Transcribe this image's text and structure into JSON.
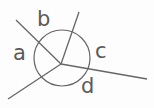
{
  "diagram": {
    "type": "angles-around-point",
    "center": {
      "x": 61,
      "y": 64
    },
    "circle": {
      "cx": 62,
      "cy": 58,
      "r": 28
    },
    "rays": [
      {
        "name": "ray-upper-left",
        "x2": 16,
        "y2": 20
      },
      {
        "name": "ray-up",
        "x2": 79,
        "y2": 12
      },
      {
        "name": "ray-right",
        "x2": 147,
        "y2": 79
      },
      {
        "name": "ray-lower-left",
        "x2": 8,
        "y2": 99
      }
    ],
    "labels": [
      {
        "text": "a",
        "x": 13,
        "y": 43
      },
      {
        "text": "b",
        "x": 37,
        "y": 9
      },
      {
        "text": "c",
        "x": 95,
        "y": 41
      },
      {
        "text": "d",
        "x": 81,
        "y": 76
      }
    ],
    "colors": {
      "line": "#666666",
      "text": "#5a5a5a",
      "background": "#fdfdfd"
    }
  }
}
